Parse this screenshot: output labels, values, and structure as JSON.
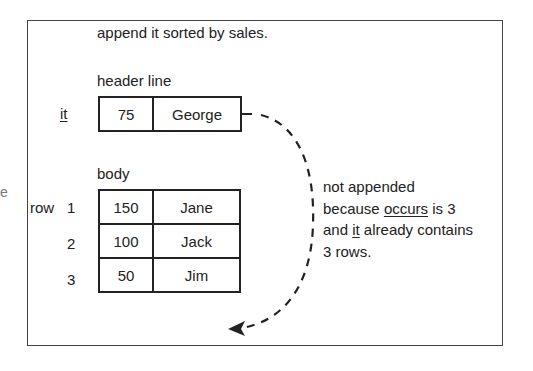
{
  "caption_top": "append it sorted by sales.",
  "header_line": {
    "label": "header line",
    "table_name": "it",
    "cells": [
      "75",
      "George"
    ]
  },
  "body": {
    "label": "body",
    "row_label": "row",
    "rows": [
      {
        "index": "1",
        "sales": "150",
        "name": "Jane"
      },
      {
        "index": "2",
        "sales": "100",
        "name": "Jack"
      },
      {
        "index": "3",
        "sales": "50",
        "name": "Jim"
      }
    ]
  },
  "annotation": {
    "line1": "not appended",
    "line2_pre": "because ",
    "line2_u": "occurs",
    "line2_post": " is 3",
    "line3_pre": "and ",
    "line3_u": "it",
    "line3_post": " already contains",
    "line4": "3 rows."
  },
  "stray_mark": "e",
  "colors": {
    "line": "#222222",
    "frame": "#444444",
    "background": "#ffffff"
  }
}
